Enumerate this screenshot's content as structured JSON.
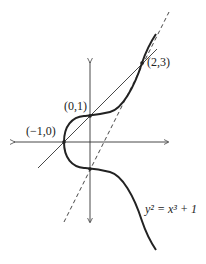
{
  "diagram": {
    "equation": {
      "text": "y² = x³ + 1"
    },
    "points": [
      {
        "label": "(−1,0)",
        "x": -1,
        "y": 0
      },
      {
        "label": "(0,1)",
        "x": 0,
        "y": 1
      },
      {
        "label": "(2,3)",
        "x": 2,
        "y": 3
      }
    ],
    "lines": [
      {
        "type": "solid",
        "description": "line through (-1,0), (0,1), (2,3): y = x + 1"
      },
      {
        "type": "dashed",
        "description": "tangent at (2,3): y = 2x - 1"
      }
    ],
    "colors": {
      "stroke": "#222222",
      "background": "#ffffff"
    }
  }
}
